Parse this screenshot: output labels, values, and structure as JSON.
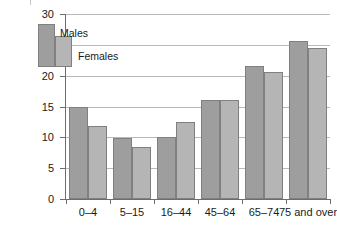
{
  "chart_data": {
    "type": "bar",
    "title": "",
    "subtitle": "",
    "xlabel": "",
    "ylabel": "",
    "categories": [
      "0–4",
      "5–15",
      "16–44",
      "45–64",
      "65–74",
      "75 and over"
    ],
    "series": [
      {
        "name": "Males",
        "color": "#9e9e9e",
        "values": [
          15.0,
          9.9,
          10.1,
          16.0,
          21.6,
          25.7
        ]
      },
      {
        "name": "Females",
        "color": "#b5b5b5",
        "values": [
          11.8,
          8.5,
          12.5,
          16.0,
          20.6,
          24.5
        ]
      }
    ],
    "ylim": [
      0,
      30
    ],
    "yticks": [
      0,
      5,
      10,
      15,
      20,
      25,
      30
    ],
    "ytick_labels": [
      "0",
      "5",
      "10",
      "15",
      "20",
      "25",
      "30"
    ],
    "grid": true,
    "grid_axis": "y",
    "legend_position": "top-left",
    "legend_entries": [
      "Males",
      "Females"
    ]
  },
  "axes": {
    "y_tick_labels": [
      "30",
      "25",
      "20",
      "15",
      "10",
      "5",
      "0"
    ],
    "x_tick_labels": [
      "0–4",
      "5–15",
      "16–44",
      "45–64",
      "65–74",
      "75 and over"
    ]
  },
  "legend": {
    "males_label": "Males",
    "females_label": "Females"
  },
  "colors": {
    "males_bar": "#9e9e9e",
    "females_bar": "#b5b5b5",
    "bar_border": "#808080",
    "gridline": "#b9b9b9",
    "axis": "#6d6d6d",
    "text": "#1a1a1a",
    "background": "#ffffff"
  }
}
